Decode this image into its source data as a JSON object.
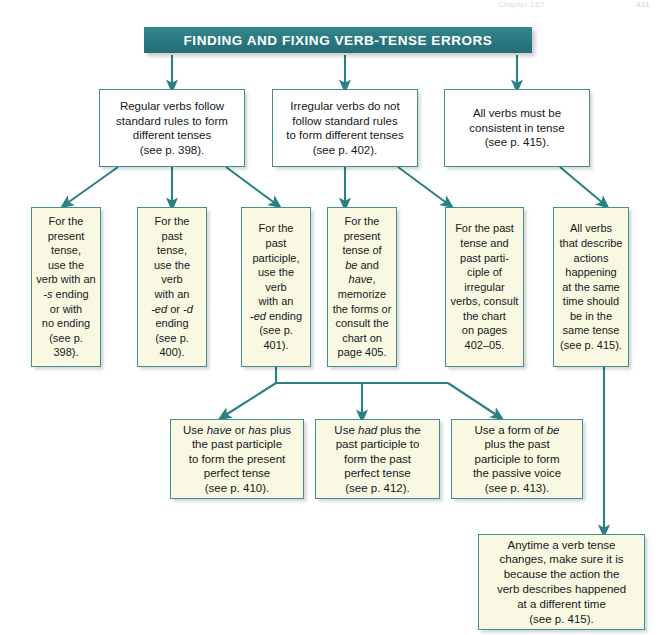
{
  "page": {
    "running_head": "Chapter 16?",
    "folio": "421",
    "title": "FINDING AND FIXING VERB-TENSE ERRORS",
    "accent_color": "#2b7f86",
    "border_color": "#3f8f90",
    "box_fill_white": "#ffffff",
    "box_fill_cream": "#f9f8e3",
    "banner_text_color": "#ffffff"
  },
  "row1": [
    {
      "id": "regular-verbs",
      "text": "Regular verbs follow\nstandard rules to form\ndifferent tenses\n(see p. 398).",
      "page_ref": "see p. 398"
    },
    {
      "id": "irregular-verbs",
      "text": "Irregular verbs do not\nfollow standard rules\nto form different tenses\n(see p. 402).",
      "page_ref": "see p. 402"
    },
    {
      "id": "consistent-tense",
      "text": "All verbs must be\nconsistent in tense\n(see p. 415).",
      "page_ref": "see p. 415"
    }
  ],
  "row2": [
    {
      "id": "present-tense",
      "text": "For the\npresent\ntense,\nuse the\nverb with an\n-s ending\nor with\nno ending\n(see p. 398).",
      "page_ref": "see p. 398"
    },
    {
      "id": "past-tense",
      "text": "For the\npast\ntense,\nuse the\nverb\nwith an\n-ed or -d\nending\n(see p. 400).",
      "page_ref": "see p. 400"
    },
    {
      "id": "past-participle",
      "text": "For the\npast\nparticiple,\nuse the\nverb\nwith an\n-ed ending\n(see p. 401).",
      "page_ref": "see p. 401"
    },
    {
      "id": "be-have-present",
      "text": "For the\npresent\ntense of\nbe and have,\nmemorize\nthe forms or\nconsult the\nchart on\npage 405.",
      "page_ref": "page 405"
    },
    {
      "id": "irregular-chart",
      "text": "For the past\ntense and\npast parti-\nciple of\nirregular\nverbs, consult\nthe chart\non pages\n402–05.",
      "page_ref": "pages 402–05"
    },
    {
      "id": "same-time-same-tense",
      "text": "All verbs\nthat describe\nactions\nhappening\nat the same\ntime should\nbe in the\nsame tense\n(see p. 415).",
      "page_ref": "see p. 415"
    }
  ],
  "row3": [
    {
      "id": "present-perfect",
      "text": "Use have or has plus\nthe past participle\nto form the present\nperfect tense\n(see p. 410).",
      "page_ref": "see p. 410"
    },
    {
      "id": "past-perfect",
      "text": "Use had plus the\npast participle to\nform the past\nperfect tense\n(see p. 412).",
      "page_ref": "see p. 412"
    },
    {
      "id": "passive-voice",
      "text": "Use a form of be\nplus the past\nparticiple to form\nthe passive voice\n(see p. 413).",
      "page_ref": "see p. 413"
    }
  ],
  "row4": [
    {
      "id": "tense-change-reason",
      "text": "Anytime a verb tense\nchanges, make sure it is\nbecause the action the\nverb describes happened\nat a different time\n(see p. 415).",
      "page_ref": "see p. 415"
    }
  ]
}
